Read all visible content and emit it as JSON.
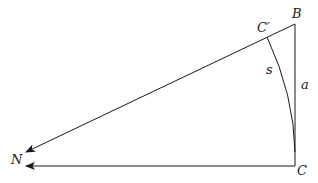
{
  "diagram": {
    "type": "geometry",
    "labels": {
      "B": "B",
      "C_prime": "C′",
      "s": "s",
      "a": "a",
      "N": "N",
      "C": "C"
    },
    "points": {
      "B": [
        295,
        24
      ],
      "C": [
        295,
        166
      ],
      "C_prime": [
        267,
        37
      ],
      "N_upper_arrow_tip": [
        26,
        152
      ],
      "N_lower_arrow_tip": [
        26,
        166
      ]
    },
    "colors": {
      "stroke": "#1a1a1a",
      "background": "#ffffff"
    }
  }
}
